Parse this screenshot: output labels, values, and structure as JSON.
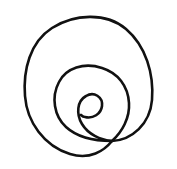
{
  "image": {
    "title": "Hand-drawn spiral",
    "subject": "spiral",
    "style": "single continuous freehand black line drawing",
    "background_color": "#ffffff",
    "stroke_color": "#111111",
    "stroke_width": 2.6,
    "width": 177,
    "height": 169,
    "turns": 2.5,
    "winding": "clockwise-inward",
    "description": "A freehand ink spiral of about two and a half turns, drawn as one unbroken line. The outermost loop forms a large slightly irregular circle; a second loop nests inside it and its outer end runs tangentially into the outer loop at the lower right; the line continues inward to a small tight curl at the centre.",
    "paths": {
      "outer_loop": "M 112 141 C 132 140 150 124 152 100 C 154 74 146 46 126 29 C 106 12 74 14 52 28 C 30 42 23 70 25 96 C 27 122 44 146 70 154 C 90 160 104 151 112 141 Z",
      "inner_loop": "M 112 141 C 122 132 130 118 129 103 C 128 86 118 73 102 68 C 84 62 66 68 59 82 C 51 97 54 116 66 127 C 78 138 97 141 112 141",
      "inner_curl": "M 112 141 C 100 140 88 134 82 124 C 76 114 77 101 86 96 C 94 91 103 97 102 106 C 101 114 93 119 85 117 C 83 117 82 116 81 115"
    },
    "bounds": {
      "outer_left": 24,
      "outer_right": 152,
      "outer_top": 18,
      "outer_bottom": 156,
      "inner_left": 56,
      "inner_right": 130,
      "inner_top": 68,
      "inner_bottom": 145,
      "center_x": 86,
      "center_y": 108
    }
  }
}
